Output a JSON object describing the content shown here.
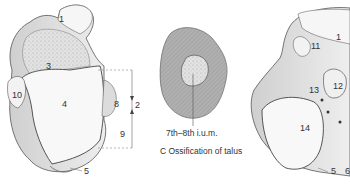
{
  "figure_left": {
    "labels": [
      "1",
      "3",
      "10",
      "4",
      "8",
      "2",
      "9",
      "5"
    ]
  },
  "figure_middle": {
    "age_label": "7th–8th i.u.m.",
    "caption": "C  Ossification of talus"
  },
  "figure_right": {
    "labels": [
      "1",
      "11",
      "12",
      "13",
      "14",
      "5",
      "6"
    ]
  },
  "colors": {
    "bone_fill": "#f4f4f4",
    "bone_shade": "#bdbdbd",
    "cartilage_gray": "#a9a9a9",
    "outline": "#555555",
    "text": "#333333"
  }
}
